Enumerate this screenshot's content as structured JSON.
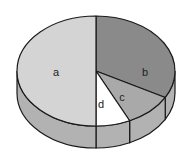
{
  "chart_data": {
    "type": "pie",
    "style": "3d",
    "title": "",
    "categories": [
      "a",
      "b",
      "c",
      "d"
    ],
    "values": [
      50,
      33,
      10,
      7
    ],
    "colors": {
      "a": "#d4d4d4",
      "b": "#8a8a8a",
      "c": "#a9a9a9",
      "d": "#ffffff"
    },
    "side_color": "#b2b2b2",
    "outline_color": "#1a1a1a",
    "legend": "none",
    "labels_inside": true
  },
  "labels": {
    "a": "a",
    "b": "b",
    "c": "c",
    "d": "d"
  }
}
